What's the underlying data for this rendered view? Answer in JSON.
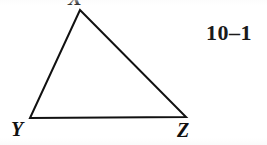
{
  "figure": {
    "caption_number": "10–1",
    "shape_type": "triangle",
    "fill": "none",
    "stroke_color": "#111111",
    "stroke_width_px": 2,
    "background_color": "#ffffff",
    "canvas": {
      "width": 267,
      "height": 145
    },
    "vertices": [
      {
        "label": "X",
        "x": 80,
        "y": 10,
        "label_position": "above",
        "clipped": true
      },
      {
        "label": "Y",
        "x": 30,
        "y": 118,
        "label_position": "below-left",
        "clipped": false
      },
      {
        "label": "Z",
        "x": 186,
        "y": 117,
        "label_position": "below-right",
        "clipped": false
      }
    ],
    "edges": [
      {
        "name": "XY",
        "from": "X",
        "to": "Y"
      },
      {
        "name": "YZ",
        "from": "Y",
        "to": "Z"
      },
      {
        "name": "ZX",
        "from": "Z",
        "to": "X"
      }
    ]
  }
}
